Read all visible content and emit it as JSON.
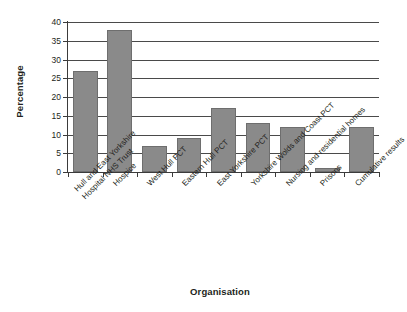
{
  "chart_data": {
    "type": "bar",
    "title": "",
    "xlabel": "Organisation",
    "ylabel": "Percentage",
    "ylim": [
      0,
      40
    ],
    "ytick_step": 5,
    "yticks": [
      0,
      5,
      10,
      15,
      20,
      25,
      30,
      35,
      40
    ],
    "grid": true,
    "legend": false,
    "bar_color": "#8a8a8a",
    "bar_edge_color": "#6e6e6e",
    "axis_color": "#3b3b3b",
    "categories": [
      "Hull and East Yorkshire Hospital NHS Trust",
      "Hospice",
      "West Hull PCT",
      "Eastern Hull PCT",
      "East Yorkshire PCT",
      "Yorkshire Wolds and Coast PCT",
      "Nursing and residential homes",
      "Prisons",
      "Cumulative results"
    ],
    "category_lines": [
      [
        "Hull and East Yorkshire",
        "Hospital NHS Trust"
      ],
      [
        "Hospice"
      ],
      [
        "West Hull PCT"
      ],
      [
        "Eastern Hull PCT"
      ],
      [
        "East Yorkshire PCT"
      ],
      [
        "Yorkshire Wolds and Coast PCT"
      ],
      [
        "Nursing and residential homes"
      ],
      [
        "Prisons"
      ],
      [
        "Cumulative results"
      ]
    ],
    "values": [
      27,
      38,
      7,
      9,
      17,
      13,
      12,
      1,
      12
    ]
  }
}
